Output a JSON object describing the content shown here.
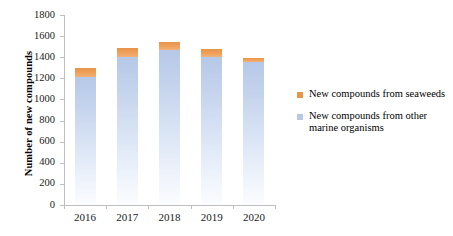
{
  "chart_data": {
    "type": "bar",
    "subtype": "stacked-column",
    "title": "",
    "xlabel": "",
    "ylabel": "Number of new compounds",
    "categories": [
      "2016",
      "2017",
      "2018",
      "2019",
      "2020"
    ],
    "ylim": [
      0,
      1800
    ],
    "yticks": [
      0,
      200,
      400,
      600,
      800,
      1000,
      1200,
      1400,
      1600,
      1800
    ],
    "ytick_labels": [
      "0",
      "200",
      "400",
      "600",
      "800",
      "1000",
      "1200",
      "1400",
      "1600",
      "1800"
    ],
    "grid": false,
    "legend_position": "right",
    "series": [
      {
        "name": "New compounds from other marine organisms",
        "color": "#b6c8e8",
        "values": [
          1210,
          1400,
          1470,
          1400,
          1355
        ]
      },
      {
        "name": "New compounds from seaweeds",
        "color": "#e8944a",
        "values": [
          85,
          85,
          75,
          80,
          40
        ]
      }
    ],
    "totals": [
      1295,
      1485,
      1545,
      1480,
      1395
    ],
    "stack_order": [
      "New compounds from other marine organisms",
      "New compounds from seaweeds"
    ]
  },
  "legend": {
    "items": [
      {
        "label": "New compounds from seaweeds",
        "color": "#e8944a"
      },
      {
        "label": "New compounds from other marine organisms",
        "color": "#b6c8e8"
      }
    ]
  },
  "axes": {
    "y_title": "Number of new compounds"
  },
  "colors": {
    "seaweeds": "#e8944a",
    "other_marine": "#b6c8e8",
    "axis": "#bfbfbf",
    "text": "#000000",
    "background": "#ffffff"
  }
}
